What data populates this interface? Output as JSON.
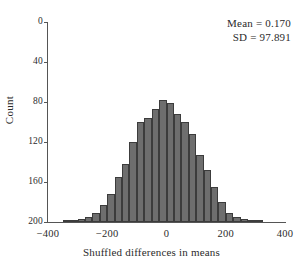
{
  "chart_data": {
    "type": "bar",
    "title": "",
    "subtitle": "",
    "xlabel": "Shuffled differences in means",
    "ylabel": "Count",
    "xlim": [
      -400,
      400
    ],
    "ylim": [
      0,
      200
    ],
    "y_axis_inverted": true,
    "grid": false,
    "legend": null,
    "bin_width": 25,
    "xticks": [
      -400,
      -200,
      0,
      200,
      400
    ],
    "xtick_labels": [
      "−400",
      "−200",
      "0",
      "200",
      "400"
    ],
    "yticks": [
      0,
      40,
      80,
      120,
      160,
      200
    ],
    "ytick_labels": [
      "0",
      "40",
      "80",
      "120",
      "160",
      "200"
    ],
    "bar_color": "#6e6e6e",
    "bar_edge_color": "#3c3c3c",
    "axis_color": "#555555",
    "bin_centers": [
      -337.5,
      -312.5,
      -287.5,
      -262.5,
      -237.5,
      -212.5,
      -187.5,
      -162.5,
      -137.5,
      -112.5,
      -87.5,
      -62.5,
      -37.5,
      -12.5,
      12.5,
      37.5,
      62.5,
      87.5,
      112.5,
      137.5,
      162.5,
      187.5,
      212.5,
      237.5,
      262.5,
      287.5,
      312.5
    ],
    "categories": [
      "-337.5",
      "-312.5",
      "-287.5",
      "-262.5",
      "-237.5",
      "-212.5",
      "-187.5",
      "-162.5",
      "-137.5",
      "-112.5",
      "-87.5",
      "-62.5",
      "-37.5",
      "-12.5",
      "12.5",
      "37.5",
      "62.5",
      "87.5",
      "112.5",
      "137.5",
      "162.5",
      "187.5",
      "212.5",
      "237.5",
      "262.5",
      "287.5",
      "312.5"
    ],
    "values": [
      1,
      2,
      3,
      5,
      9,
      17,
      28,
      45,
      58,
      80,
      100,
      104,
      113,
      122,
      119,
      108,
      100,
      88,
      67,
      52,
      35,
      20,
      9,
      5,
      3,
      2,
      1
    ],
    "annotations": [
      {
        "text": "Mean = 0.170",
        "position": "top-right"
      },
      {
        "text": "SD = 97.891",
        "position": "top-right"
      }
    ]
  },
  "annotation": {
    "mean_line": "Mean = 0.170",
    "sd_line": "SD = 97.891"
  },
  "axes": {
    "x_title": "Shuffled differences in means",
    "y_title": "Count"
  }
}
